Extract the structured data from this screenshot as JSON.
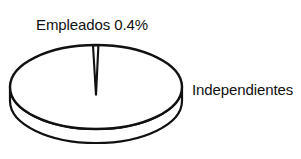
{
  "figure": {
    "width": 301,
    "height": 159,
    "background_color": "#FFFFFF",
    "stroke_color": "#111111",
    "fill_color": "#FFFFFF"
  },
  "labels": {
    "slice_small": "Empleados 0.4%",
    "slice_large": "Independientes"
  },
  "chart_data": {
    "type": "pie",
    "title": "",
    "subtitle": "",
    "xlabel": "",
    "ylabel": "",
    "legend_position": "none",
    "grid": false,
    "three_d": true,
    "categories": [
      "Empleados",
      "Independientes"
    ],
    "values": [
      0.4,
      99.6
    ],
    "value_unit": "%",
    "data_labels": [
      "Empleados 0.4%",
      "Independientes"
    ],
    "slices": [
      {
        "name": "Empleados",
        "value": 0.4,
        "label": "Empleados 0.4%",
        "label_position": "outside-top-left",
        "fill": "#FFFFFF",
        "stroke": "#111111"
      },
      {
        "name": "Independientes",
        "value": 99.6,
        "label": "Independientes",
        "label_position": "outside-right",
        "fill": "#FFFFFF",
        "stroke": "#111111"
      }
    ],
    "geometry": {
      "center_x": 96,
      "center_y": 87,
      "radius_x": 86,
      "radius_y": 42,
      "depth": 14,
      "start_angle_deg": -90
    }
  }
}
